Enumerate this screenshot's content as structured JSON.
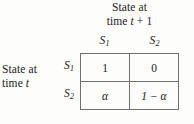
{
  "figure": {
    "caption_top": {
      "line1": "State at",
      "line2_prefix": "time ",
      "line2_var": "t",
      "line2_suffix": " + 1"
    },
    "caption_left": {
      "line1": "State at",
      "line2_prefix": "time ",
      "line2_var": "t"
    },
    "column_headers": [
      {
        "symbol": "S",
        "subscript": "1"
      },
      {
        "symbol": "S",
        "subscript": "2"
      }
    ],
    "row_headers": [
      {
        "symbol": "S",
        "subscript": "1"
      },
      {
        "symbol": "S",
        "subscript": "2"
      }
    ],
    "cells": [
      [
        "1",
        "0"
      ],
      [
        "α",
        "1 − α"
      ]
    ],
    "colors": {
      "background": "#fdfdfb",
      "text": "#1b1b1b",
      "rule": "#6f6f6f"
    }
  }
}
